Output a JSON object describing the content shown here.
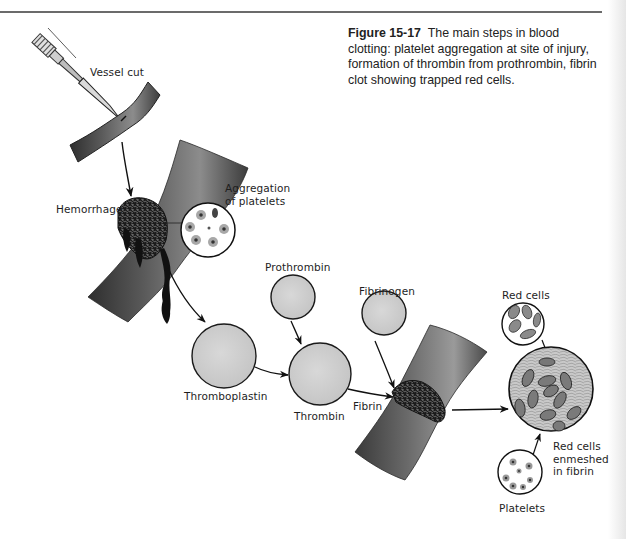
{
  "caption": {
    "figure_number": "Figure 15-17",
    "text": "The main steps in blood clotting: platelet aggregation at site of injury, formation of thrombin from prothrombin, fibrin clot showing trapped red cells."
  },
  "labels": {
    "vessel_cut": "Vessel cut",
    "hemorrhage": "Hemorrhage",
    "aggregation_line1": "Aggregation",
    "aggregation_line2": "of platelets",
    "prothrombin": "Prothrombin",
    "thromboplastin": "Thromboplastin",
    "thrombin": "Thrombin",
    "fibrinogen": "Fibrinogen",
    "fibrin": "Fibrin",
    "red_cells": "Red cells",
    "enmeshed_line1": "Red cells",
    "enmeshed_line2": "enmeshed",
    "enmeshed_line3": "in fibrin",
    "platelets": "Platelets"
  },
  "colors": {
    "factor_circle_fill": "#cfcfcf",
    "vessel_dark": "#3a3a3a",
    "vessel_light": "#9a9a9a",
    "clot": "#1c1c1c",
    "red_cell": "#8a8a8a",
    "outline": "#1a1a1a"
  }
}
